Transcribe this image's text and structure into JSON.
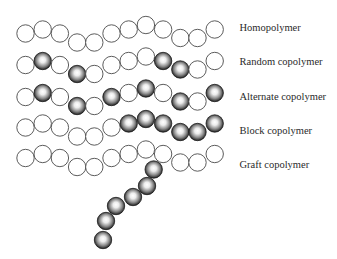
{
  "figure": {
    "monomer_legend": {
      "A": "hollow white circle",
      "B": "shaded dark sphere"
    },
    "rows": [
      {
        "label": "Homopolymer",
        "sequence": "AAAAAAAAAAAA"
      },
      {
        "label": "Random copolymer",
        "sequence": "ABABAAAABBAA"
      },
      {
        "label": "Alternate copolymer",
        "sequence": "ABABABABABAB"
      },
      {
        "label": "Block copolymer",
        "sequence": "AAAAAABBBBBB"
      },
      {
        "label": "Graft copolymer",
        "sequence": "AAAAAAAAAAAA"
      }
    ],
    "graft_branch": {
      "row_index": 4,
      "units": 6,
      "monomer": "B"
    }
  }
}
